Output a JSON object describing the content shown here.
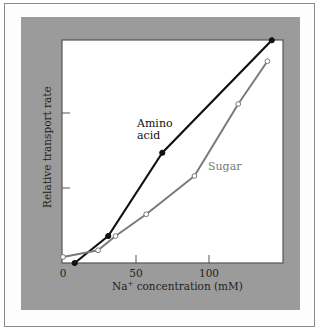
{
  "chart_data": {
    "type": "line",
    "title": "",
    "xlabel": "Na+ concentration (mM)",
    "xlabel_parts": {
      "base": "Na",
      "sup": "+",
      "rest": " concentration (mM)"
    },
    "ylabel": "Relative transport rate",
    "xlim": [
      0,
      150
    ],
    "ylim": [
      0,
      3
    ],
    "x_ticks": [
      0,
      50,
      100
    ],
    "x_tick_labels": [
      "0",
      "50",
      "100"
    ],
    "y_ticks": [
      1,
      2
    ],
    "y_tick_labels": [
      "",
      ""
    ],
    "grid": false,
    "legend": "inline annotations",
    "series": [
      {
        "name": "Amino acid",
        "label_lines": [
          "Amino",
          "acid"
        ],
        "color": "#111111",
        "marker": "filled-circle",
        "x": [
          8,
          31,
          68,
          143
        ],
        "y": [
          0.0,
          0.36,
          1.47,
          2.97
        ]
      },
      {
        "name": "Sugar",
        "label_lines": [
          "Sugar"
        ],
        "color": "#7a7a7a",
        "marker": "open-circle",
        "x": [
          0,
          24,
          36,
          57,
          90,
          120,
          140
        ],
        "y": [
          0.08,
          0.17,
          0.36,
          0.65,
          1.16,
          2.12,
          2.69
        ]
      }
    ]
  },
  "colors": {
    "panel": "#9b9b9b",
    "plot_bg": "#ffffff",
    "frame": "#8a8a8a"
  }
}
